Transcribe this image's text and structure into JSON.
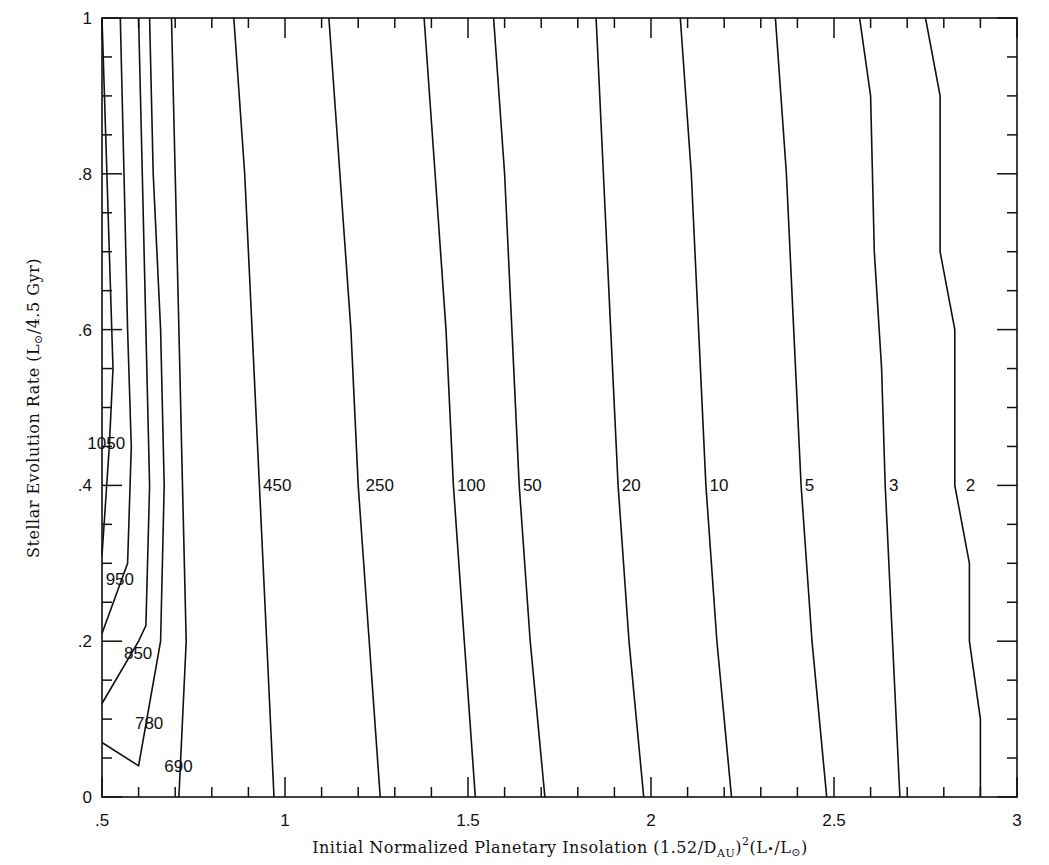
{
  "chart_data": {
    "type": "contour",
    "title": "",
    "xlabel": "Initial Normalized Planetary Insolation (1.52/D_AU)^2 (L*/L_sun)",
    "ylabel": "Stellar Evolution Rate (L_sun/4.5 Gyr)",
    "xlim": [
      0.5,
      3
    ],
    "ylim": [
      0,
      1
    ],
    "grid": false,
    "legend": "none",
    "x_ticks": [
      0.5,
      1,
      1.5,
      2,
      2.5,
      3
    ],
    "x_tick_labels": [
      ".5",
      "1",
      "1.5",
      "2",
      "2.5",
      "3"
    ],
    "y_ticks": [
      0,
      0.2,
      0.4,
      0.6,
      0.8,
      1
    ],
    "y_tick_labels": [
      "0",
      ".2",
      ".4",
      ".6",
      ".8",
      "1"
    ],
    "contour_levels": [
      1050,
      950,
      850,
      780,
      690,
      450,
      250,
      100,
      50,
      20,
      10,
      5,
      3,
      2
    ],
    "contours": [
      {
        "level": 1050,
        "label": "1050",
        "points": [
          [
            0.5,
            1.0
          ],
          [
            0.51,
            0.85
          ],
          [
            0.52,
            0.7
          ],
          [
            0.53,
            0.55
          ],
          [
            0.52,
            0.45
          ],
          [
            0.5,
            0.31
          ]
        ]
      },
      {
        "level": 950,
        "label": "950",
        "points": [
          [
            0.55,
            1.0
          ],
          [
            0.56,
            0.8
          ],
          [
            0.57,
            0.6
          ],
          [
            0.58,
            0.45
          ],
          [
            0.57,
            0.3
          ],
          [
            0.5,
            0.21
          ]
        ]
      },
      {
        "level": 850,
        "label": "850",
        "points": [
          [
            0.6,
            1.0
          ],
          [
            0.61,
            0.8
          ],
          [
            0.62,
            0.6
          ],
          [
            0.63,
            0.4
          ],
          [
            0.62,
            0.22
          ],
          [
            0.6,
            0.2
          ],
          [
            0.5,
            0.12
          ]
        ]
      },
      {
        "level": 780,
        "label": "780",
        "points": [
          [
            0.63,
            1.0
          ],
          [
            0.64,
            0.8
          ],
          [
            0.66,
            0.6
          ],
          [
            0.67,
            0.4
          ],
          [
            0.66,
            0.2
          ],
          [
            0.6,
            0.04
          ],
          [
            0.5,
            0.07
          ]
        ]
      },
      {
        "level": 690,
        "label": "690",
        "points": [
          [
            0.69,
            1.0
          ],
          [
            0.7,
            0.8
          ],
          [
            0.71,
            0.6
          ],
          [
            0.72,
            0.4
          ],
          [
            0.73,
            0.2
          ],
          [
            0.71,
            0.0
          ]
        ]
      },
      {
        "level": 450,
        "label": "450",
        "points": [
          [
            0.86,
            1.0
          ],
          [
            0.89,
            0.8
          ],
          [
            0.91,
            0.6
          ],
          [
            0.93,
            0.4
          ],
          [
            0.95,
            0.2
          ],
          [
            0.97,
            0.0
          ]
        ]
      },
      {
        "level": 250,
        "label": "250",
        "points": [
          [
            1.12,
            1.0
          ],
          [
            1.15,
            0.8
          ],
          [
            1.18,
            0.6
          ],
          [
            1.2,
            0.4
          ],
          [
            1.23,
            0.2
          ],
          [
            1.26,
            0.0
          ]
        ]
      },
      {
        "level": 100,
        "label": "100",
        "points": [
          [
            1.38,
            1.0
          ],
          [
            1.41,
            0.8
          ],
          [
            1.44,
            0.6
          ],
          [
            1.46,
            0.4
          ],
          [
            1.49,
            0.2
          ],
          [
            1.52,
            0.0
          ]
        ]
      },
      {
        "level": 50,
        "label": "50",
        "points": [
          [
            1.57,
            1.0
          ],
          [
            1.6,
            0.8
          ],
          [
            1.62,
            0.6
          ],
          [
            1.64,
            0.4
          ],
          [
            1.67,
            0.2
          ],
          [
            1.71,
            0.0
          ]
        ]
      },
      {
        "level": 20,
        "label": "20",
        "points": [
          [
            1.85,
            1.0
          ],
          [
            1.87,
            0.8
          ],
          [
            1.89,
            0.6
          ],
          [
            1.91,
            0.4
          ],
          [
            1.94,
            0.2
          ],
          [
            1.98,
            0.0
          ]
        ]
      },
      {
        "level": 10,
        "label": "10",
        "points": [
          [
            2.08,
            1.0
          ],
          [
            2.11,
            0.8
          ],
          [
            2.13,
            0.6
          ],
          [
            2.15,
            0.4
          ],
          [
            2.18,
            0.2
          ],
          [
            2.22,
            0.0
          ]
        ]
      },
      {
        "level": 5,
        "label": "5",
        "points": [
          [
            2.34,
            1.0
          ],
          [
            2.37,
            0.8
          ],
          [
            2.39,
            0.6
          ],
          [
            2.41,
            0.4
          ],
          [
            2.44,
            0.2
          ],
          [
            2.48,
            0.0
          ]
        ]
      },
      {
        "level": 3,
        "label": "3",
        "points": [
          [
            2.57,
            1.0
          ],
          [
            2.6,
            0.9
          ],
          [
            2.61,
            0.7
          ],
          [
            2.63,
            0.55
          ],
          [
            2.64,
            0.4
          ],
          [
            2.67,
            0.1
          ],
          [
            2.68,
            0.0
          ]
        ]
      },
      {
        "level": 2,
        "label": "2",
        "points": [
          [
            2.75,
            1.0
          ],
          [
            2.79,
            0.9
          ],
          [
            2.79,
            0.7
          ],
          [
            2.83,
            0.6
          ],
          [
            2.83,
            0.4
          ],
          [
            2.87,
            0.3
          ],
          [
            2.87,
            0.2
          ],
          [
            2.9,
            0.1
          ],
          [
            2.9,
            0.0
          ]
        ]
      }
    ],
    "annotations": [
      {
        "text": "1050",
        "x": 0.46,
        "y": 0.455
      },
      {
        "text": "950",
        "x": 0.51,
        "y": 0.28
      },
      {
        "text": "850",
        "x": 0.56,
        "y": 0.185
      },
      {
        "text": "780",
        "x": 0.59,
        "y": 0.095
      },
      {
        "text": "690",
        "x": 0.67,
        "y": 0.04
      },
      {
        "text": "450",
        "x": 0.94,
        "y": 0.4
      },
      {
        "text": "250",
        "x": 1.22,
        "y": 0.4
      },
      {
        "text": "100",
        "x": 1.47,
        "y": 0.4
      },
      {
        "text": "50",
        "x": 1.65,
        "y": 0.4
      },
      {
        "text": "20",
        "x": 1.92,
        "y": 0.4
      },
      {
        "text": "10",
        "x": 2.16,
        "y": 0.4
      },
      {
        "text": "5",
        "x": 2.42,
        "y": 0.4
      },
      {
        "text": "3",
        "x": 2.65,
        "y": 0.4
      },
      {
        "text": "2",
        "x": 2.86,
        "y": 0.4
      }
    ]
  },
  "axes": {
    "x_title_main": "Initial Normalized Planetary Insolation (1.52/D",
    "x_title_sub": "AU",
    "x_title_close": ")",
    "x_title_sup": "2",
    "x_title_tail": "(L",
    "x_title_star": "•",
    "x_title_mid": "/L",
    "x_title_sun": "⊙",
    "x_title_end": ")",
    "y_title_main": "Stellar Evolution Rate (L",
    "y_title_sun": "⊙",
    "y_title_end": "/4.5 Gyr)"
  },
  "layout": {
    "plot_left": 102,
    "plot_right": 1017,
    "plot_top": 18,
    "plot_bottom": 797
  }
}
